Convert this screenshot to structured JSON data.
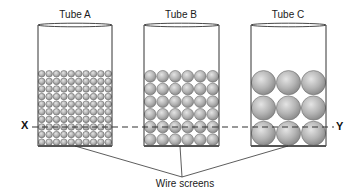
{
  "diagram": {
    "tubes": [
      {
        "label": "Tube A",
        "cols": 10,
        "rows": 10,
        "x": 38,
        "w": 74
      },
      {
        "label": "Tube B",
        "cols": 6,
        "rows": 6,
        "x": 144,
        "w": 75
      },
      {
        "label": "Tube C",
        "cols": 3,
        "rows": 3,
        "x": 251,
        "w": 75
      }
    ],
    "line_left_label": "X",
    "line_right_label": "Y",
    "wire_screens_label": "Wire screens",
    "colors": {
      "sphere_fill": "#b4b4b4",
      "sphere_stroke": "#6a6a6a",
      "outline": "#333333",
      "dash": "#333333"
    }
  }
}
